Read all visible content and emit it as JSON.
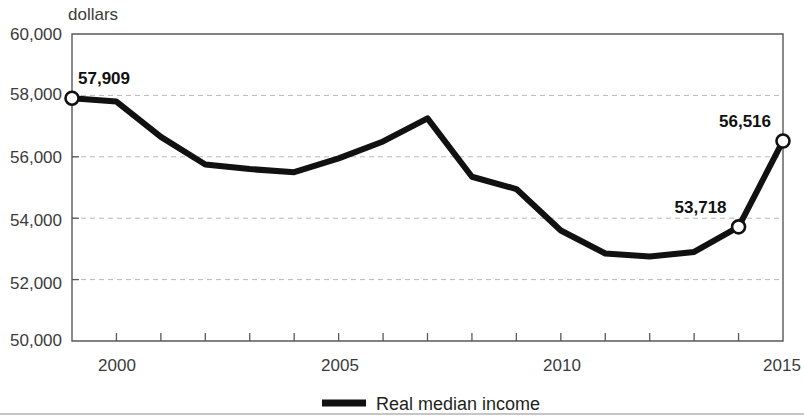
{
  "chart_data": {
    "type": "line",
    "title": "",
    "subtitle": "",
    "xlabel": "",
    "ylabel": "dollars",
    "unit_label": "dollars",
    "xlim": [
      1999,
      2015
    ],
    "ylim": [
      50000,
      60000
    ],
    "grid": true,
    "gridlines_y": [
      52000,
      54000,
      56000,
      58000
    ],
    "y_ticks": [
      50000,
      52000,
      54000,
      56000,
      58000,
      60000
    ],
    "y_tick_labels": [
      "50,000",
      "52,000",
      "54,000",
      "56,000",
      "58,000",
      "60,000"
    ],
    "x_ticks": [
      2000,
      2005,
      2010,
      2015
    ],
    "x_tick_labels": [
      "2000",
      "2005",
      "2010",
      "2015"
    ],
    "x_minor_ticks": [
      2000,
      2001,
      2002,
      2003,
      2004,
      2005,
      2006,
      2007,
      2008,
      2009,
      2010,
      2011,
      2012,
      2013,
      2014,
      2015
    ],
    "legend_position": "bottom-center",
    "legend": [
      "Real median income"
    ],
    "series": [
      {
        "name": "Real median income",
        "color": "#111111",
        "x": [
          1999,
          2000,
          2001,
          2002,
          2003,
          2004,
          2005,
          2006,
          2007,
          2008,
          2009,
          2010,
          2011,
          2012,
          2013,
          2014,
          2015
        ],
        "values": [
          57909,
          57800,
          56650,
          55750,
          55600,
          55500,
          55950,
          56500,
          57250,
          55350,
          54950,
          53600,
          52850,
          52750,
          52900,
          53718,
          56516
        ]
      }
    ],
    "annotations": [
      {
        "text": "57,909",
        "x": 1999,
        "y": 57909,
        "marker": true,
        "anchor": "start"
      },
      {
        "text": "53,718",
        "x": 2014,
        "y": 53718,
        "marker": true,
        "anchor": "end"
      },
      {
        "text": "56,516",
        "x": 2015,
        "y": 56516,
        "marker": true,
        "anchor": "end"
      }
    ]
  },
  "labels": {
    "unit": "dollars",
    "y0": "50,000",
    "y1": "52,000",
    "y2": "54,000",
    "y3": "56,000",
    "y4": "58,000",
    "y5": "60,000",
    "x0": "2000",
    "x1": "2005",
    "x2": "2010",
    "x3": "2015",
    "ann0": "57,909",
    "ann1": "53,718",
    "ann2": "56,516",
    "legend0": "Real median income"
  }
}
